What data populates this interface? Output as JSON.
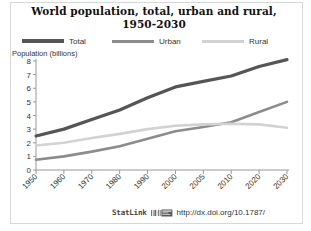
{
  "figure": {
    "title_line1": "World population, total, urban and rural,",
    "title_line2": "1950-2030",
    "y_axis_title": "Population (billions)",
    "background": "#ffffff",
    "border_color": "#d8d8d8"
  },
  "legend": {
    "position": "top",
    "items": [
      {
        "label": "Total",
        "color": "#555555",
        "name": "legend-total"
      },
      {
        "label": "Urban",
        "color": "#8c8c8c",
        "name": "legend-urban"
      },
      {
        "label": "Rural",
        "color": "#d2d2d2",
        "name": "legend-rural"
      }
    ]
  },
  "footer": {
    "statlink_label": "StatLink",
    "icon": "barcode-icon",
    "url": "http://dx.doi.org/10.1787/"
  },
  "chart_data": {
    "type": "line",
    "title": "World population, total, urban and rural, 1950-2030",
    "xlabel": "",
    "ylabel": "Population (billions)",
    "categories": [
      "1950",
      "1960",
      "1970",
      "1980",
      "1990",
      "2000",
      "2005",
      "2010",
      "2020",
      "2030"
    ],
    "ylim": [
      0,
      8
    ],
    "yticks": [
      0,
      1,
      2,
      3,
      4,
      5,
      6,
      7,
      8
    ],
    "grid": false,
    "legend_position": "top",
    "series": [
      {
        "name": "Total",
        "color": "#555555",
        "values": [
          2.5,
          3.0,
          3.7,
          4.4,
          5.3,
          6.1,
          6.5,
          6.9,
          7.6,
          8.1
        ]
      },
      {
        "name": "Urban",
        "color": "#8c8c8c",
        "values": [
          0.75,
          1.0,
          1.35,
          1.75,
          2.3,
          2.85,
          3.15,
          3.5,
          4.25,
          5.0
        ]
      },
      {
        "name": "Rural",
        "color": "#d2d2d2",
        "values": [
          1.8,
          2.0,
          2.35,
          2.65,
          3.0,
          3.25,
          3.35,
          3.4,
          3.35,
          3.1
        ]
      }
    ],
    "annotations": [
      {
        "text": "Urban overtakes Rural around 2007"
      }
    ]
  }
}
